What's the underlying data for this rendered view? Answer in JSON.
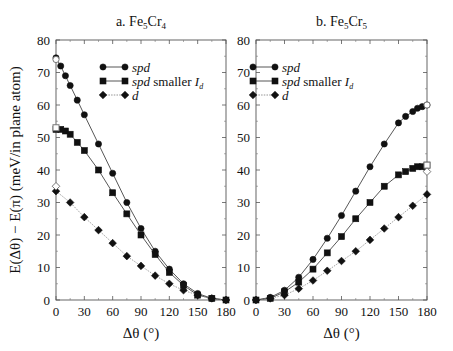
{
  "figure": {
    "ylabel": "E(Δθ) − E(π)   (meV/in plane atom)",
    "xlabel": "Δθ   (°)"
  },
  "chart_data": [
    {
      "type": "line",
      "title": "a. Fe5Cr4",
      "xlabel": "Δθ (°)",
      "ylabel": "E(Δθ) − E(π) (meV/in plane atom)",
      "xlim": [
        0,
        180
      ],
      "ylim": [
        0,
        80
      ],
      "xticks": [
        0,
        30,
        60,
        90,
        120,
        150,
        180
      ],
      "yticks": [
        0,
        10,
        20,
        30,
        40,
        50,
        60,
        70,
        80
      ],
      "legend_position": "upper right",
      "series": [
        {
          "name": "spd",
          "marker": "circle",
          "line": "solid",
          "x": [
            0,
            5,
            10,
            15,
            22.5,
            30,
            45,
            60,
            75,
            90,
            105,
            120,
            135,
            150,
            165,
            180
          ],
          "y": [
            74.5,
            72,
            69,
            66,
            61.5,
            57,
            48,
            39,
            30,
            22,
            15,
            9.5,
            5,
            2,
            0.5,
            0
          ]
        },
        {
          "name": "spd smaller I_d",
          "marker": "square",
          "line": "solid",
          "x": [
            0,
            5,
            10,
            15,
            22.5,
            30,
            45,
            60,
            75,
            90,
            105,
            120,
            135,
            150,
            165,
            180
          ],
          "y": [
            52.5,
            52.5,
            52,
            51,
            48.5,
            46,
            40,
            33,
            26.5,
            20,
            14,
            8.5,
            4.5,
            1.5,
            0.5,
            0
          ]
        },
        {
          "name": "d",
          "marker": "diamond",
          "line": "dotted",
          "x": [
            0,
            15,
            30,
            45,
            60,
            75,
            90,
            105,
            120,
            135,
            150,
            165,
            180
          ],
          "y": [
            33.5,
            30,
            25.5,
            21.5,
            17.5,
            13.5,
            10.5,
            7.5,
            5,
            3,
            1.5,
            0.5,
            0
          ]
        }
      ],
      "annotations": [
        {
          "x": 0,
          "y": 74,
          "marker": "open-circle"
        },
        {
          "x": 0,
          "y": 53,
          "marker": "open-square"
        },
        {
          "x": 0,
          "y": 35,
          "marker": "open-diamond"
        }
      ]
    },
    {
      "type": "line",
      "title": "b. Fe5Cr5",
      "xlabel": "Δθ (°)",
      "ylabel": "",
      "xlim": [
        0,
        180
      ],
      "ylim": [
        0,
        80
      ],
      "xticks": [
        0,
        30,
        60,
        90,
        120,
        150,
        180
      ],
      "yticks": [
        0,
        10,
        20,
        30,
        40,
        50,
        60,
        70,
        80
      ],
      "legend_position": "upper left",
      "series": [
        {
          "name": "spd",
          "marker": "circle",
          "line": "solid",
          "x": [
            0,
            15,
            30,
            45,
            60,
            75,
            90,
            105,
            120,
            135,
            150,
            157.5,
            165,
            170,
            175,
            180
          ],
          "y": [
            0,
            0.8,
            3,
            7,
            12.5,
            19,
            26,
            33.5,
            41,
            48,
            54.5,
            56.5,
            58,
            59,
            59.5,
            60
          ]
        },
        {
          "name": "spd smaller I_d",
          "marker": "square",
          "line": "solid",
          "x": [
            0,
            15,
            30,
            45,
            60,
            75,
            90,
            105,
            120,
            135,
            150,
            157.5,
            165,
            170,
            175,
            180
          ],
          "y": [
            0,
            0.5,
            2.5,
            5.5,
            9.5,
            14.5,
            19.5,
            25,
            30,
            35,
            38.5,
            39.5,
            40.5,
            41,
            41,
            41.5
          ]
        },
        {
          "name": "d",
          "marker": "diamond",
          "line": "dotted",
          "x": [
            0,
            15,
            30,
            45,
            60,
            75,
            90,
            105,
            120,
            135,
            150,
            165,
            180
          ],
          "y": [
            0,
            0.5,
            1.5,
            3.5,
            6,
            9,
            12,
            15,
            18.5,
            22,
            25.5,
            29,
            32.5
          ]
        }
      ],
      "annotations": [
        {
          "x": 180,
          "y": 60,
          "marker": "open-circle"
        },
        {
          "x": 180,
          "y": 41.5,
          "marker": "open-square"
        },
        {
          "x": 180,
          "y": 39.5,
          "marker": "open-diamond"
        }
      ]
    }
  ],
  "legend": {
    "items": [
      {
        "label": "spd",
        "italic": "spd",
        "suffix": ""
      },
      {
        "label": "spd smaller I_d",
        "italic": "spd",
        "suffix": " smaller ",
        "sub": "d",
        "I": "I"
      },
      {
        "label": "d",
        "italic": "d",
        "suffix": ""
      }
    ]
  }
}
